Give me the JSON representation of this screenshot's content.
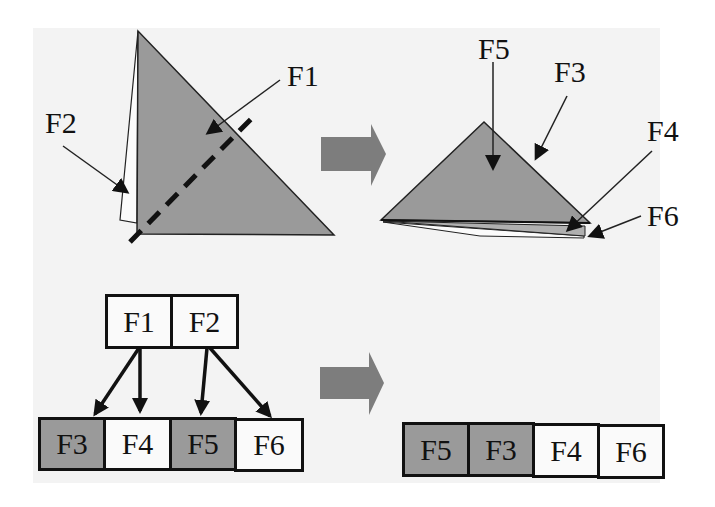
{
  "figure": {
    "top_left": {
      "labels": {
        "f1": "F1",
        "f2": "F2"
      },
      "description": "Triangle F1 with thin flap F2 behind, dashed fold line"
    },
    "top_right": {
      "labels": {
        "f5": "F5",
        "f3": "F3",
        "f4": "F4",
        "f6": "F6"
      },
      "description": "Folded result: stacked triangles"
    },
    "bottom_left": {
      "parents": [
        {
          "label": "F1",
          "shaded": false
        },
        {
          "label": "F2",
          "shaded": false
        }
      ],
      "children": [
        {
          "label": "F3",
          "shaded": true
        },
        {
          "label": "F4",
          "shaded": false
        },
        {
          "label": "F5",
          "shaded": true
        },
        {
          "label": "F6",
          "shaded": false
        }
      ]
    },
    "bottom_right": {
      "stack_order": [
        {
          "label": "F5",
          "shaded": true
        },
        {
          "label": "F3",
          "shaded": true
        },
        {
          "label": "F4",
          "shaded": false
        },
        {
          "label": "F6",
          "shaded": false
        }
      ]
    },
    "colors": {
      "face_fill": "#9a9a9a",
      "arrow_fill": "#7a7a7a",
      "stroke": "#111111",
      "background": "#f3f3f3"
    }
  }
}
